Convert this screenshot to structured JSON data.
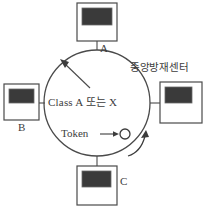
{
  "diagram": {
    "ring": {
      "center_label": "Class A 또는 X",
      "token_label": "Token",
      "direction": "clockwise"
    },
    "nodes": [
      {
        "id": "top",
        "label": "A",
        "icon": "control-panel-icon"
      },
      {
        "id": "left",
        "label": "B",
        "icon": "control-panel-icon"
      },
      {
        "id": "right",
        "label": "중앙방재센터",
        "icon": "control-panel-icon"
      },
      {
        "id": "bottom",
        "label": "C",
        "icon": "control-panel-icon"
      }
    ],
    "caption": "",
    "colors": {
      "stroke": "#3c3c3c",
      "screen": "#3a3a3a",
      "background": "#ffffff",
      "text": "#3c3c3c"
    }
  }
}
